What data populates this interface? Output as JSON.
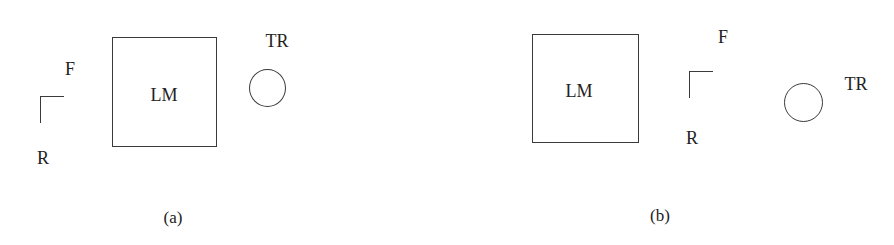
{
  "panels": [
    {
      "id": "a",
      "caption": "(a)",
      "landmark_label": "LM",
      "frame_label_forward": "F",
      "frame_label_right": "R",
      "target_label": "TR"
    },
    {
      "id": "b",
      "caption": "(b)",
      "landmark_label": "LM",
      "frame_label_forward": "F",
      "frame_label_right": "R",
      "target_label": "TR"
    }
  ]
}
